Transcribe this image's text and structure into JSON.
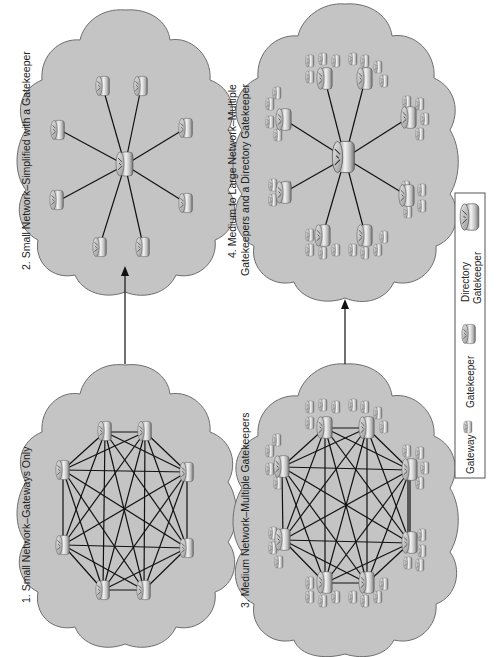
{
  "figure": {
    "orientation": "rotated-90-ccw",
    "colors": {
      "cloud_fill": "#c4c4c4",
      "cloud_stroke": "#6e6e6e",
      "link": "#111111",
      "background": "#ffffff"
    }
  },
  "panels": [
    {
      "id": "net1",
      "label": "1. Small Network–Gateways Only",
      "topology": "full-mesh",
      "nodes": "gateways",
      "node_count": 8
    },
    {
      "id": "net2",
      "label": "2. Small Network–Simplified with a Gatekeeper",
      "topology": "hub-and-spoke",
      "hub": "gatekeeper",
      "node_count": 8
    },
    {
      "id": "net3",
      "label": "3. Medium Network–Multiple Gatekeepers",
      "topology": "full-mesh",
      "nodes": "gatekeepers with gateway clusters",
      "node_count": 8
    },
    {
      "id": "net4",
      "label_line1": "4. Medium to Large Network–Multiple",
      "label_line2": "Gatekeepers and a Directory Gatekeeper",
      "topology": "hub-and-spoke",
      "hub": "directory gatekeeper",
      "node_count": 8
    }
  ],
  "arrows": [
    {
      "from": "net1",
      "to": "net2"
    },
    {
      "from": "net3",
      "to": "net4"
    }
  ],
  "legend": {
    "items": [
      {
        "label": "Gateway",
        "icon": "gateway-icon"
      },
      {
        "label": "Gatekeeper",
        "icon": "gatekeeper-icon"
      },
      {
        "label_line1": "Directory",
        "label_line2": "Gatekeeper",
        "icon": "directory-gatekeeper-icon"
      }
    ]
  }
}
